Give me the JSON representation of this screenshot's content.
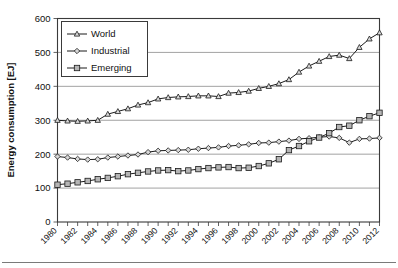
{
  "chart_data": {
    "type": "line",
    "title": "",
    "xlabel": "",
    "ylabel": "Energy consumption [EJ]",
    "xlim": [
      1980,
      2012
    ],
    "ylim": [
      0,
      600
    ],
    "yticks": [
      0,
      100,
      200,
      300,
      400,
      500,
      600
    ],
    "ytick_labels": [
      "0",
      "100",
      "200",
      "300",
      "400",
      "500",
      "600"
    ],
    "grid": "horizontal",
    "legend_position": "top-left-inside",
    "x": [
      1980,
      1981,
      1982,
      1983,
      1984,
      1985,
      1986,
      1987,
      1988,
      1989,
      1990,
      1991,
      1992,
      1993,
      1994,
      1995,
      1996,
      1997,
      1998,
      1999,
      2000,
      2001,
      2002,
      2003,
      2004,
      2005,
      2006,
      2007,
      2008,
      2009,
      2010,
      2011,
      2012
    ],
    "xtick_labels": [
      "1980",
      "1982",
      "1984",
      "1986",
      "1988",
      "1990",
      "1992",
      "1994",
      "1996",
      "1998",
      "2000",
      "2002",
      "2004",
      "2006",
      "2008",
      "2010",
      "2012"
    ],
    "series": [
      {
        "name": "World",
        "marker": "triangle",
        "values": [
          300,
          298,
          297,
          298,
          300,
          318,
          326,
          334,
          345,
          352,
          363,
          367,
          369,
          370,
          372,
          372,
          370,
          380,
          382,
          386,
          394,
          400,
          408,
          420,
          442,
          460,
          474,
          488,
          492,
          482,
          515,
          540,
          558
        ]
      },
      {
        "name": "Industrial",
        "marker": "diamond",
        "values": [
          193,
          190,
          186,
          184,
          185,
          190,
          193,
          196,
          199,
          206,
          210,
          211,
          212,
          213,
          216,
          218,
          220,
          224,
          226,
          229,
          233,
          234,
          237,
          240,
          245,
          247,
          250,
          252,
          248,
          234,
          245,
          246,
          248
        ]
      },
      {
        "name": "Emerging",
        "marker": "square",
        "values": [
          110,
          113,
          117,
          121,
          126,
          130,
          135,
          141,
          145,
          149,
          152,
          153,
          150,
          152,
          156,
          159,
          161,
          162,
          159,
          160,
          165,
          173,
          185,
          212,
          224,
          238,
          249,
          262,
          280,
          284,
          300,
          312,
          322
        ]
      }
    ]
  },
  "legend": {
    "items": [
      {
        "label": "World",
        "marker": "triangle"
      },
      {
        "label": "Industrial",
        "marker": "diamond"
      },
      {
        "label": "Emerging",
        "marker": "square"
      }
    ]
  }
}
